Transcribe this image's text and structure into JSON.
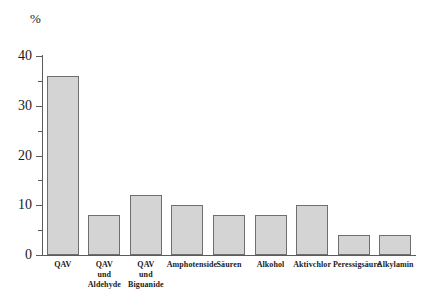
{
  "chart_data": {
    "type": "bar",
    "title": "",
    "subtitle": "",
    "xlabel": "",
    "ylabel": "%",
    "unit_label": "%",
    "ylim": [
      0,
      40
    ],
    "yticks": [
      0,
      10,
      20,
      30,
      40
    ],
    "ytick_labels": [
      "0",
      "10",
      "20",
      "30",
      "40"
    ],
    "yticks_minor": [
      5,
      15,
      25,
      35
    ],
    "grid": false,
    "legend": null,
    "categories": [
      "QAV",
      "QAV und Aldehyde",
      "QAV und Biguanide",
      "Amphotenside",
      "Säuren",
      "Alkohol",
      "Aktivchlor",
      "Peressigsäure",
      "Alkylamin"
    ],
    "category_lines": [
      [
        "QAV"
      ],
      [
        "QAV",
        "und",
        "Aldehyde"
      ],
      [
        "QAV",
        "und",
        "Biguanide"
      ],
      [
        "Amphotenside"
      ],
      [
        "Säuren"
      ],
      [
        "Alkohol"
      ],
      [
        "Aktivchlor"
      ],
      [
        "Peressigsäure"
      ],
      [
        "Alkylamin"
      ]
    ],
    "values": [
      36,
      8,
      12,
      10,
      8,
      8,
      10,
      4,
      4
    ],
    "bar_color": "#d4d4d4",
    "bar_edge_color": "#6f6f6f",
    "axis_color": "#5b5b5b",
    "text_color": "#1a1a1a",
    "background_color": "#ffffff"
  }
}
